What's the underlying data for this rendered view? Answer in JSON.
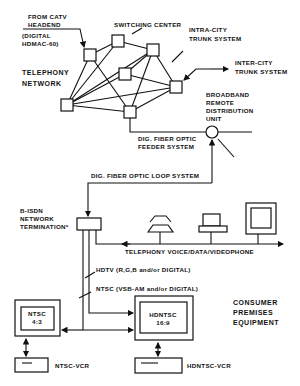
{
  "diagram": {
    "network": {
      "title_line1": "TELEPHONY",
      "title_line2": "NETWORK",
      "catv": {
        "line1": "FROM CATV",
        "line2": "HEADEND",
        "line3": "(DIGITAL",
        "line4": "HDMAC-60)"
      },
      "switching_center": "SWITCHING CENTER",
      "intra_city_line1": "INTRA-CITY",
      "intra_city_line2": "TRUNK SYSTEM",
      "inter_city_line1": "INTER-CITY",
      "inter_city_line2": "TRUNK SYSTEM"
    },
    "remote_unit": {
      "line1": "BROADBAND",
      "line2": "REMOTE",
      "line3": "DISTRIBUTION",
      "line4": "UNIT"
    },
    "feeder": {
      "line1": "DIG. FIBER OPTIC",
      "line2": "FEEDER SYSTEM"
    },
    "loop": "DIG. FIBER OPTIC LOOP SYSTEM",
    "termination": {
      "line1": "B-ISDN",
      "line2": "NETWORK",
      "line3": "TERMINATION*"
    },
    "telephony_bus": "TELEPHONY  VOICE/DATA/VIDEOPHONE",
    "hdtv_signal": "HDTV  (R,G,B  and/or  DIGITAL)",
    "ntsc_signal": "NTSC  (VSB-AM  and/or  DIGITAL)",
    "ntsc_tv": {
      "line1": "NTSC",
      "line2": "4:3"
    },
    "hdntsc_tv": {
      "line1": "HDNTSC",
      "line2": "16:9"
    },
    "ntsc_vcr": "NTSC-VCR",
    "hdntsc_vcr": "HDNTSC-VCR",
    "cpe": {
      "line1": "CONSUMER",
      "line2": "PREMISES",
      "line3": "EQUIPMENT"
    }
  }
}
